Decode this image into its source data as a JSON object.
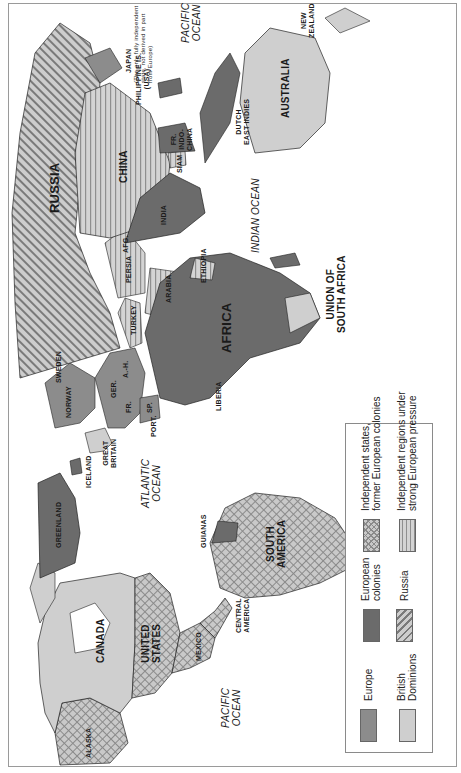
{
  "map": {
    "orientation": "rotated 90 degrees counterclockwise",
    "colors": {
      "europe": "#8c8c8c",
      "european_colonies": "#6b6b6b",
      "british_dominions": "#cfcfcf",
      "russia_fill": "#c8c8c8",
      "russia_stripe": "#7a7a7a",
      "independent_former_colonies_fill": "#c4c4c4",
      "independent_pressure_fill": "#d2d2d2",
      "outline": "#222222",
      "frame": "#9a9a9a"
    },
    "regions": {
      "russia": "RUSSIA",
      "china": "CHINA",
      "india": "INDIA",
      "africa": "AFRICA",
      "australia": "AUSTRALIA",
      "canada": "CANADA",
      "united_states": "UNITED\nSTATES",
      "south_america": "SOUTH\nAMERICA",
      "mexico": "MEXICO",
      "central_america": "CENTRAL\nAMERICA",
      "alaska": "ALASKA",
      "greenland": "GREENLAND",
      "iceland": "ICELAND",
      "great_britain": "GREAT\nBRITAIN",
      "norway": "NORWAY",
      "sweden": "SWEDEN",
      "germany": "GER.",
      "austria_hungary": "A.-H.",
      "france": "FR.",
      "spain": "SP.",
      "portugal": "PORT.",
      "turkey": "TURKEY",
      "persia": "PERSIA",
      "afghanistan": "AFG.",
      "arabia": "ARABIA",
      "ethiopia": "ETHIOPIA",
      "liberia": "LIBERIA",
      "union_of_south_africa": "UNION OF\nSOUTH AFRICA",
      "guianas": "GUIANAS",
      "siam": "SIAM",
      "fr_indo_china": "FR.\nINDO-\nCHINA",
      "dutch_east_indies": "DUTCH\nEAST INDIES",
      "philippine_is": "PHILIPPINE IS.\n(USA)",
      "japan": "JAPAN",
      "japan_note": "(The only fully independent\nstate, not derived in part\nfrom Europe)",
      "new_zealand": "NEW\nZEALAND"
    },
    "oceans": {
      "atlantic": "ATLANTIC\nOCEAN",
      "pacific_east": "PACIFIC\nOCEAN",
      "pacific_west": "PACIFIC\nOCEAN",
      "indian": "INDIAN OCEAN"
    }
  },
  "legend": {
    "items": [
      {
        "key": "europe",
        "label": "Europe"
      },
      {
        "key": "british_dominions",
        "label": "British\nDominions"
      },
      {
        "key": "european_colonies",
        "label": "European\ncolonies"
      },
      {
        "key": "russia",
        "label": "Russia"
      },
      {
        "key": "independent_former_colonies",
        "label": "Independent states,\nformer European colonies"
      },
      {
        "key": "independent_pressure",
        "label": "Independent regions under\nstrong European pressure"
      }
    ]
  }
}
